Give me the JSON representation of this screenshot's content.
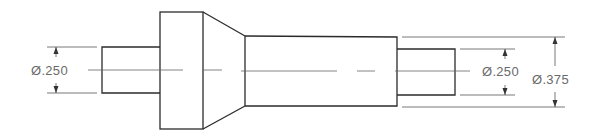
{
  "drawing": {
    "type": "stepped shaft technical drawing",
    "colors": {
      "object_line": "#2b2b2b",
      "dimension_line": "#555555",
      "dimension_text": "#6a6a6a",
      "background": "#ffffff"
    },
    "dimensions": [
      {
        "id": "left-shaft-diameter",
        "label": "Ø.250"
      },
      {
        "id": "right-shaft-diameter",
        "label": "Ø.250"
      },
      {
        "id": "main-body-diameter",
        "label": "Ø.375"
      }
    ]
  }
}
